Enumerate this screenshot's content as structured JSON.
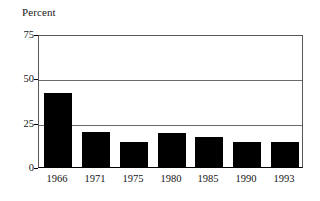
{
  "chart_data": {
    "type": "bar",
    "title": "",
    "ylabel": "Percent",
    "xlabel": "",
    "categories": [
      "1966",
      "1971",
      "1975",
      "1980",
      "1985",
      "1990",
      "1993"
    ],
    "values": [
      42,
      20,
      14,
      19,
      17,
      14,
      14
    ],
    "ylim": [
      0,
      75
    ],
    "yticks": [
      "0",
      "25",
      "50",
      "75"
    ],
    "ytick_values": [
      0,
      25,
      50,
      75
    ],
    "grid": true,
    "legend": null,
    "series_color": "#000000",
    "gridline_color": "#6b6b6e",
    "axis_color": "#000000",
    "background_color": "#ffffff"
  }
}
